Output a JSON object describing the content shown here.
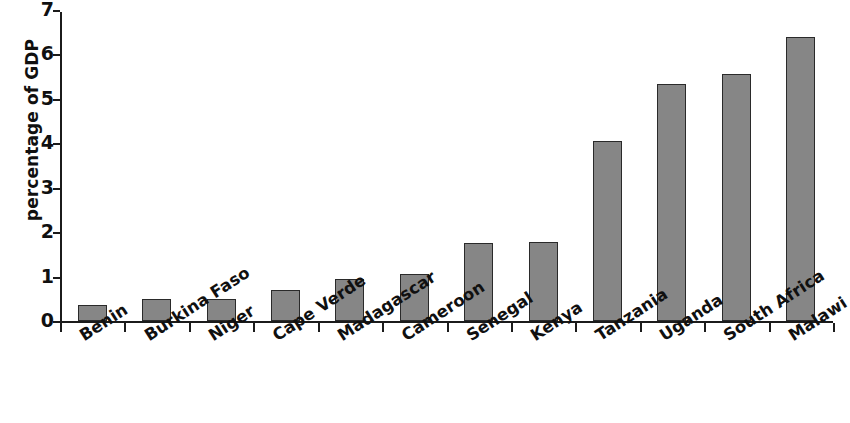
{
  "chart_data": {
    "type": "bar",
    "title": "",
    "subtitle": "",
    "xlabel": "",
    "ylabel": "percentage of GDP",
    "categories": [
      "Benin",
      "Burkina Faso",
      "Niger",
      "Cape Verde",
      "Madagascar",
      "Cameroon",
      "Senegal",
      "Kenya",
      "Tanzania",
      "Uganda",
      "South Africa",
      "Malawi"
    ],
    "values": [
      0.36,
      0.49,
      0.5,
      0.7,
      0.95,
      1.06,
      1.76,
      1.77,
      4.05,
      5.33,
      5.56,
      6.39
    ],
    "ylim": [
      0,
      7
    ],
    "ytick_labels": [
      "0",
      "1",
      "2",
      "3",
      "4",
      "5",
      "6",
      "7"
    ],
    "ytick_values": [
      0,
      1,
      2,
      3,
      4,
      5,
      6,
      7
    ],
    "grid": false,
    "legend": null,
    "bar_color": "#868686",
    "bar_edge_color": "#2a2a2a",
    "axis_color": "#1b1b1b",
    "background_color": "#ffffff",
    "label_rotation_degrees": -33,
    "annotations": []
  }
}
